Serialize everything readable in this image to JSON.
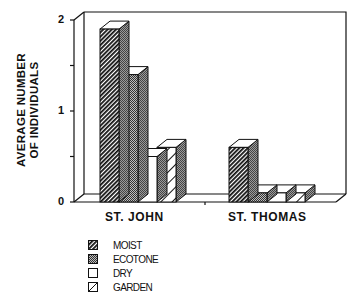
{
  "chart_data": {
    "type": "bar",
    "style": "3d-grouped-bar",
    "title": "",
    "xlabel": "",
    "ylabel": "AVERAGE NUMBER OF INDIVIDUALS",
    "ylabel_lines": [
      "AVERAGE NUMBER",
      "OF INDIVIDUALS"
    ],
    "ylim": [
      0,
      2
    ],
    "yticks": [
      0,
      1,
      2
    ],
    "ytick_labels": [
      "0",
      "1",
      "2"
    ],
    "minor_yticks": [
      0.5,
      1.5
    ],
    "grid": false,
    "categories": [
      "ST. JOHN",
      "ST. THOMAS"
    ],
    "series": [
      {
        "name": "MOIST",
        "values": [
          1.9,
          0.6
        ],
        "pattern": "dense-diagonal-hatch"
      },
      {
        "name": "ECOTONE",
        "values": [
          1.4,
          0.1
        ],
        "pattern": "gray-stipple"
      },
      {
        "name": "DRY",
        "values": [
          0.5,
          0.1
        ],
        "pattern": "white"
      },
      {
        "name": "GARDEN",
        "values": [
          0.6,
          0.1
        ],
        "pattern": "sparse-diagonal-hatch"
      }
    ],
    "legend_position": "bottom-left",
    "legend": [
      "MOIST",
      "ECOTONE",
      "DRY",
      "GARDEN"
    ]
  }
}
